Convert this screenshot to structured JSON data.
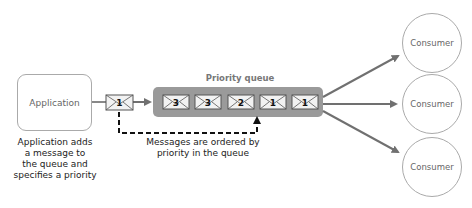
{
  "application": {
    "label": "Application"
  },
  "application_caption": [
    "Application adds",
    "a message to",
    "the queue and",
    "specifies a priority"
  ],
  "incoming_message": {
    "priority": "1"
  },
  "queue": {
    "title": "Priority queue",
    "messages": [
      {
        "priority": "3"
      },
      {
        "priority": "3"
      },
      {
        "priority": "2"
      },
      {
        "priority": "1"
      },
      {
        "priority": "1"
      }
    ]
  },
  "ordering_caption": [
    "Messages are ordered by",
    "priority in the queue"
  ],
  "consumers": [
    {
      "label": "Consumer"
    },
    {
      "label": "Consumer"
    },
    {
      "label": "Consumer"
    }
  ],
  "colors": {
    "queue_fill": "#9a9a9a",
    "arrow": "#707070",
    "border": "#aaaaaa",
    "envelope_fill": "#f2f2f2"
  }
}
